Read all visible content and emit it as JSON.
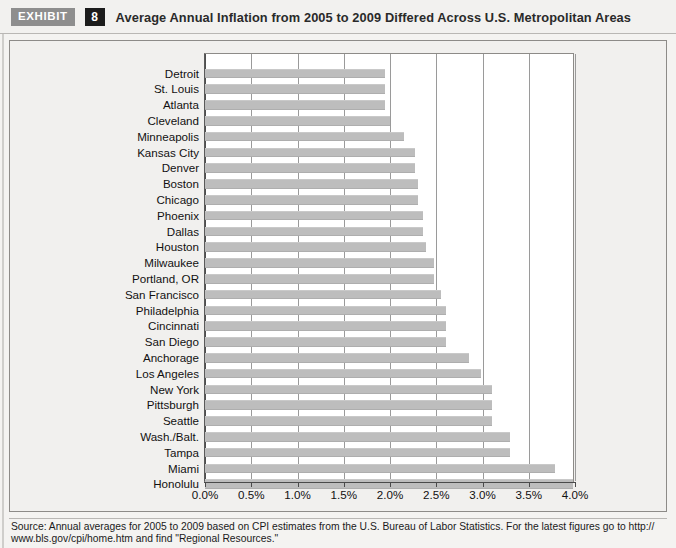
{
  "header": {
    "exhibit_tag": "EXHIBIT",
    "exhibit_number": "8",
    "title": "Average Annual Inflation from 2005 to 2009 Differed Across U.S. Metropolitan Areas"
  },
  "footer": {
    "line1": "Source: Annual averages for 2005 to 2009 based on CPI estimates from the U.S. Bureau of Labor Statistics. For the latest figures go to http://",
    "line2": "www.bls.gov/cpi/home.htm and find \"Regional Resources.\""
  },
  "colors": {
    "bar": "#bdbdbd",
    "plot_background": "#ffffff",
    "panel_background": "#f1f0ee",
    "gridline": "#9a9a9a",
    "axis": "#4a4a4a",
    "exhibit_tag_bg": "#8e8e8e",
    "exhibit_number_bg": "#1c1c1c"
  },
  "chart_data": {
    "type": "bar",
    "orientation": "horizontal",
    "title": "Average Annual Inflation from 2005 to 2009 Differed Across U.S. Metropolitan Areas",
    "xlabel": "",
    "ylabel": "",
    "xlim": [
      0.0,
      4.0
    ],
    "xticks": [
      0.0,
      0.5,
      1.0,
      1.5,
      2.0,
      2.5,
      3.0,
      3.5,
      4.0
    ],
    "xtick_labels": [
      "0.0%",
      "0.5%",
      "1.0%",
      "1.5%",
      "2.0%",
      "2.5%",
      "3.0%",
      "3.5%",
      "4.0%"
    ],
    "grid": true,
    "legend": "none",
    "units": "percent",
    "categories": [
      "Detroit",
      "St. Louis",
      "Atlanta",
      "Cleveland",
      "Minneapolis",
      "Kansas City",
      "Denver",
      "Boston",
      "Chicago",
      "Phoenix",
      "Dallas",
      "Houston",
      "Milwaukee",
      "Portland, OR",
      "San Francisco",
      "Philadelphia",
      "Cincinnati",
      "San Diego",
      "Anchorage",
      "Los Angeles",
      "New York",
      "Pittsburgh",
      "Seattle",
      "Wash./Balt.",
      "Tampa",
      "Miami",
      "Honolulu"
    ],
    "values": [
      1.95,
      1.95,
      1.95,
      2.0,
      2.15,
      2.27,
      2.27,
      2.3,
      2.3,
      2.36,
      2.36,
      2.39,
      2.48,
      2.48,
      2.55,
      2.6,
      2.6,
      2.6,
      2.85,
      2.98,
      3.1,
      3.1,
      3.1,
      3.3,
      3.3,
      3.78,
      3.98
    ],
    "value_labels": [
      "1.95%",
      "1.95%",
      "1.95%",
      "2.0%",
      "2.15%",
      "2.27%",
      "2.27%",
      "2.3%",
      "2.3%",
      "2.36%",
      "2.36%",
      "2.39%",
      "2.48%",
      "2.48%",
      "2.55%",
      "2.6%",
      "2.6%",
      "2.6%",
      "2.85%",
      "2.98%",
      "3.1%",
      "3.1%",
      "3.1%",
      "3.3%",
      "3.3%",
      "3.78%",
      "3.98%"
    ]
  }
}
